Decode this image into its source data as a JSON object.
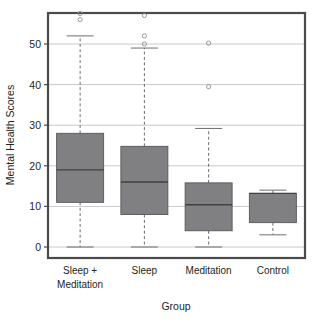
{
  "chart_data": {
    "type": "box",
    "title": "",
    "xlabel": "Group",
    "ylabel": "Mental Health Scores",
    "categories": [
      "Sleep +\nMeditation",
      "Sleep",
      "Meditation",
      "Control"
    ],
    "category_labels": [
      {
        "line1": "Sleep +",
        "line2": "Meditation"
      },
      {
        "line1": "Sleep",
        "line2": ""
      },
      {
        "line1": "Meditation",
        "line2": ""
      },
      {
        "line1": "Control",
        "line2": ""
      }
    ],
    "ylim": [
      0,
      58
    ],
    "yticks": [
      0,
      10,
      20,
      30,
      40,
      50
    ],
    "ytick_labels": [
      "0",
      "10",
      "20",
      "30",
      "40",
      "50"
    ],
    "grid": true,
    "legend": "none",
    "boxes": [
      {
        "name": "Sleep + Meditation",
        "whisker_low": 0,
        "q1": 11,
        "median": 19,
        "q3": 28,
        "whisker_high": 52,
        "outliers": [
          56,
          57.5
        ]
      },
      {
        "name": "Sleep",
        "whisker_low": 0,
        "q1": 8,
        "median": 16,
        "q3": 24.8,
        "whisker_high": 49,
        "outliers": [
          50,
          52,
          57
        ]
      },
      {
        "name": "Meditation",
        "whisker_low": 0,
        "q1": 4,
        "median": 10.4,
        "q3": 15.8,
        "whisker_high": 29.2,
        "outliers": [
          39.5,
          50.2
        ]
      },
      {
        "name": "Control",
        "whisker_low": 3,
        "q1": 6,
        "median": 13.2,
        "q3": 13.2,
        "whisker_high": 14,
        "outliers": []
      }
    ],
    "colors": {
      "box_fill": "#808083",
      "box_stroke": "#55565a",
      "median": "#3f4043",
      "whisker": "#6d6e71",
      "grid": "#b9babc",
      "frame": "#4a4a4c",
      "outlier": "#8d8e90",
      "text": "#231f20",
      "background": "#ffffff"
    }
  }
}
